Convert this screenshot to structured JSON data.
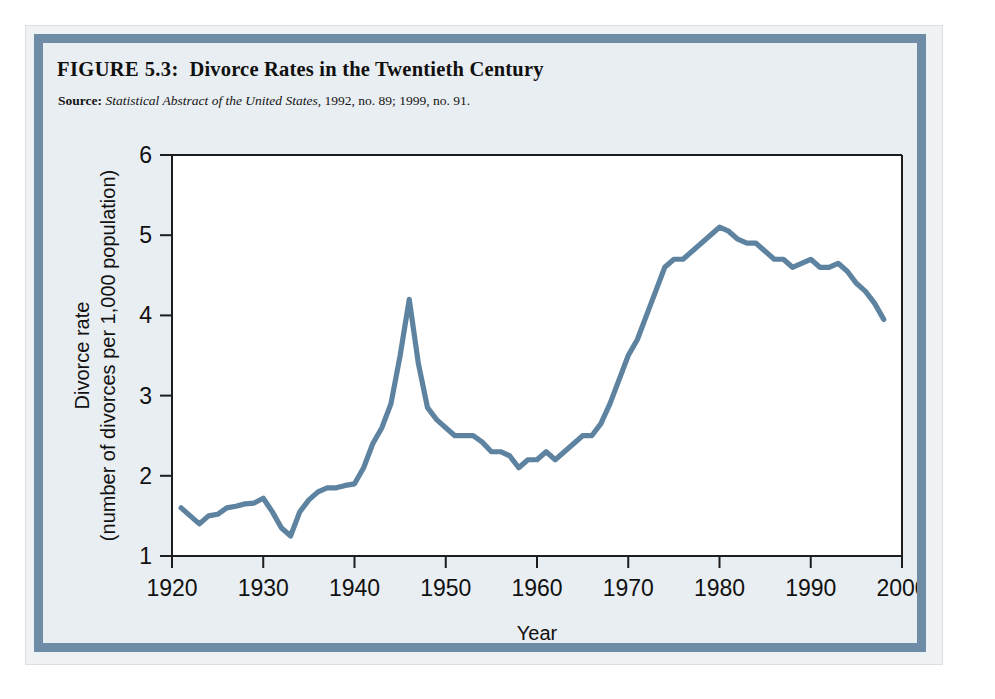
{
  "figure": {
    "label": "FIGURE 5.3:",
    "title": "Divorce Rates in the Twentieth Century",
    "source_label": "Source:",
    "source_italic": "Statistical Abstract of the United States,",
    "source_rest": " 1992, no. 89; 1999, no. 91."
  },
  "colors": {
    "line": "#5d83a0",
    "frame": "#6e8ca6",
    "plate_bg": "#e9eef2",
    "plot_bg": "#ffffff",
    "axis": "#1d1d1d",
    "text": "#111111"
  },
  "chart_data": {
    "type": "line",
    "title": "Divorce Rates in the Twentieth Century",
    "xlabel": "Year",
    "ylabel": "Divorce rate (number of divorces per 1,000 population)",
    "ylabel_line1": "Divorce rate",
    "ylabel_line2": "(number of divorces per 1,000 population)",
    "xlim": [
      1920,
      2000
    ],
    "ylim": [
      1,
      6
    ],
    "xticks": [
      1920,
      1930,
      1940,
      1950,
      1960,
      1970,
      1980,
      1990,
      2000
    ],
    "xticklabels": [
      "1920",
      "1930",
      "1940",
      "1950",
      "1960",
      "1970",
      "1980",
      "1990",
      "2000"
    ],
    "yticks": [
      1,
      2,
      3,
      4,
      5,
      6
    ],
    "yticklabels": [
      "1",
      "2",
      "3",
      "4",
      "5",
      "6"
    ],
    "grid": false,
    "legend": false,
    "series": [
      {
        "name": "Divorce rate",
        "x": [
          1921,
          1922,
          1923,
          1924,
          1925,
          1926,
          1927,
          1928,
          1929,
          1930,
          1931,
          1932,
          1933,
          1934,
          1935,
          1936,
          1937,
          1938,
          1939,
          1940,
          1941,
          1942,
          1943,
          1944,
          1945,
          1946,
          1947,
          1948,
          1949,
          1950,
          1951,
          1952,
          1953,
          1954,
          1955,
          1956,
          1957,
          1958,
          1959,
          1960,
          1961,
          1962,
          1963,
          1964,
          1965,
          1966,
          1967,
          1968,
          1969,
          1970,
          1971,
          1972,
          1973,
          1974,
          1975,
          1976,
          1977,
          1978,
          1979,
          1980,
          1981,
          1982,
          1983,
          1984,
          1985,
          1986,
          1987,
          1988,
          1989,
          1990,
          1991,
          1992,
          1993,
          1994,
          1995,
          1996,
          1997,
          1998
        ],
        "y": [
          1.6,
          1.5,
          1.4,
          1.5,
          1.52,
          1.6,
          1.62,
          1.65,
          1.66,
          1.72,
          1.55,
          1.35,
          1.25,
          1.55,
          1.7,
          1.8,
          1.85,
          1.85,
          1.88,
          1.9,
          2.1,
          2.4,
          2.6,
          2.9,
          3.5,
          4.2,
          3.4,
          2.85,
          2.7,
          2.6,
          2.5,
          2.5,
          2.5,
          2.42,
          2.3,
          2.3,
          2.25,
          2.1,
          2.2,
          2.2,
          2.3,
          2.2,
          2.3,
          2.4,
          2.5,
          2.5,
          2.65,
          2.9,
          3.2,
          3.5,
          3.7,
          4.0,
          4.3,
          4.6,
          4.7,
          4.7,
          4.8,
          4.9,
          5.0,
          5.1,
          5.05,
          4.95,
          4.9,
          4.9,
          4.8,
          4.7,
          4.7,
          4.6,
          4.65,
          4.7,
          4.6,
          4.6,
          4.65,
          4.55,
          4.4,
          4.3,
          4.15,
          3.95
        ]
      }
    ]
  },
  "axis": {
    "x_title": "Year",
    "y_title_line1": "Divorce rate",
    "y_title_line2": "(number of divorces per 1,000 population)"
  }
}
